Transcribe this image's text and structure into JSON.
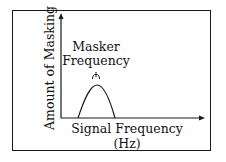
{
  "diagram": {
    "type": "masking-curve",
    "y_axis": {
      "label": "Amount of Masking"
    },
    "x_axis": {
      "label_line1": "Signal Frequency",
      "label_line2": "(Hz)"
    },
    "annotation": {
      "line1": "Masker",
      "line2": "Frequency",
      "marker": "masker-frequency-tick"
    },
    "curve": {
      "shape": "asymmetric-peak",
      "start_x": 78,
      "peak_x": 97,
      "end_x": 115
    },
    "colors": {
      "line": "#1a1a1a",
      "background": "#ffffff"
    }
  }
}
